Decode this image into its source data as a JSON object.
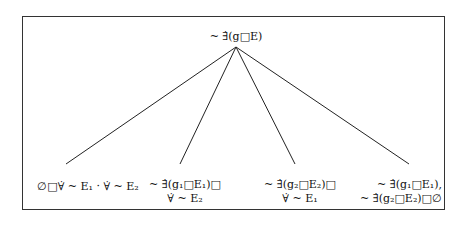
{
  "diagram": {
    "type": "tree",
    "root": {
      "label": "~ ∃̇(g□E)"
    },
    "children": [
      {
        "id": "leaf1",
        "lines": [
          "∅□∀̇ ~ E₁ · ∀̇ ~ E₂"
        ]
      },
      {
        "id": "leaf2",
        "lines": [
          "~ ∃̇(g₁□E₁)□",
          "∀̇ ~ E₂"
        ]
      },
      {
        "id": "leaf3",
        "lines": [
          "~ ∃̇(g₂□E₂)□",
          "∀̇ ~ E₁"
        ]
      },
      {
        "id": "leaf4",
        "lines": [
          "~ ∃̇(g₁□E₁),",
          "~ ∃̇(g₂□E₂)□∅"
        ]
      }
    ],
    "edges": [
      {
        "from": "root",
        "to": "leaf1"
      },
      {
        "from": "root",
        "to": "leaf2"
      },
      {
        "from": "root",
        "to": "leaf3"
      },
      {
        "from": "root",
        "to": "leaf4"
      }
    ]
  }
}
